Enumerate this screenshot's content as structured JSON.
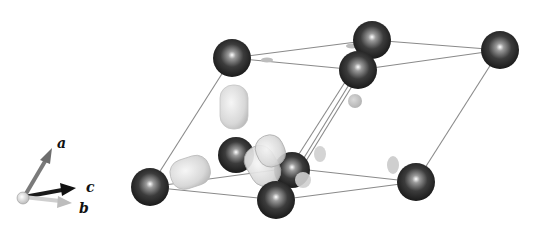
{
  "figure": {
    "axes": {
      "labels": {
        "a": "a",
        "b": "b",
        "c": "c"
      },
      "colors": {
        "a": "#7a7a7a",
        "b": "#cfcfcf",
        "c": "#1a1a1a",
        "origin": "#e8e8e8"
      }
    },
    "cell": {
      "edge_color": "#8a8a8a",
      "vertices": {
        "t1": [
          232,
          58
        ],
        "t2": [
          372,
          40
        ],
        "t3": [
          500,
          50
        ],
        "t4": [
          358,
          70
        ],
        "b1": [
          150,
          187
        ],
        "b2": [
          290,
          168
        ],
        "b3": [
          416,
          182
        ],
        "b4": [
          278,
          200
        ]
      }
    },
    "atoms": [
      {
        "id": "atom-1",
        "cx": 232,
        "cy": 58,
        "r": 19
      },
      {
        "id": "atom-2",
        "cx": 372,
        "cy": 40,
        "r": 19
      },
      {
        "id": "atom-3",
        "cx": 500,
        "cy": 50,
        "r": 19
      },
      {
        "id": "atom-4",
        "cx": 358,
        "cy": 70,
        "r": 19
      },
      {
        "id": "atom-5",
        "cx": 150,
        "cy": 187,
        "r": 19
      },
      {
        "id": "atom-6",
        "cx": 236,
        "cy": 155,
        "r": 18
      },
      {
        "id": "atom-7",
        "cx": 292,
        "cy": 170,
        "r": 18
      },
      {
        "id": "atom-8",
        "cx": 276,
        "cy": 200,
        "r": 19
      },
      {
        "id": "atom-9",
        "cx": 416,
        "cy": 182,
        "r": 19
      }
    ],
    "atom_color": "#3a3a3a",
    "isosurface_color": "#e2e2e2"
  }
}
